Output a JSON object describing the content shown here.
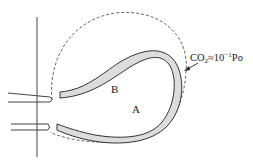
{
  "diagram": {
    "labels": {
      "region_b": "B",
      "region_a": "A"
    },
    "annotation": {
      "species": "CO",
      "subscript": "2",
      "relation": "≈10",
      "superscript": "−1",
      "unit": "Po"
    },
    "colors": {
      "stroke": "#333333",
      "fill": "#dcdcdc",
      "dashed": "#555555"
    }
  }
}
